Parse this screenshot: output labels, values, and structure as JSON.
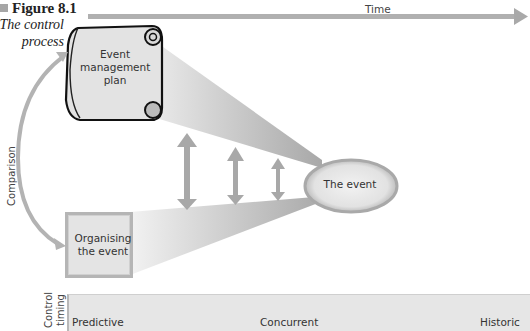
{
  "figure": {
    "number": "Figure 8.1",
    "caption_line1": "The control",
    "caption_line2": "process"
  },
  "axis": {
    "time_label": "Time"
  },
  "nodes": {
    "plan": {
      "line1": "Event",
      "line2": "management",
      "line3": "plan"
    },
    "organising": {
      "line1": "Organising",
      "line2": "the event"
    },
    "event": {
      "label": "The event"
    }
  },
  "side_labels": {
    "comparison": "Comparison",
    "control_timing_line1": "Control",
    "control_timing_line2": "timing"
  },
  "timing_bar": {
    "predictive": "Predictive",
    "concurrent": "Concurrent",
    "historic": "Historic"
  },
  "colors": {
    "arrow_gray": "#a8a8a8",
    "box_fill": "#e4e4e4",
    "beam_gray": "#bdbdbd",
    "ellipse_fill": "#e6e6e6",
    "ellipse_border": "#a9a9a9"
  }
}
